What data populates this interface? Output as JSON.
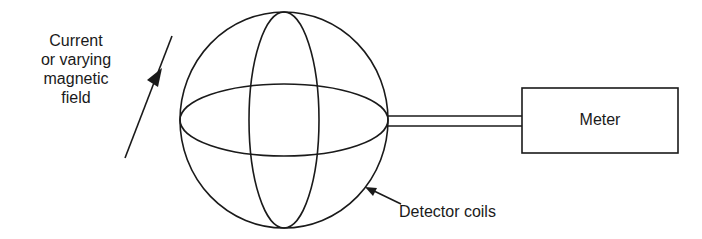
{
  "diagram": {
    "field_label": {
      "lines": [
        "Current",
        "or varying",
        "magnetic",
        "field"
      ]
    },
    "meter_label": "Meter",
    "coils_label": "Detector coils",
    "colors": {
      "stroke": "#1a1a1a",
      "background": "#ffffff"
    }
  }
}
